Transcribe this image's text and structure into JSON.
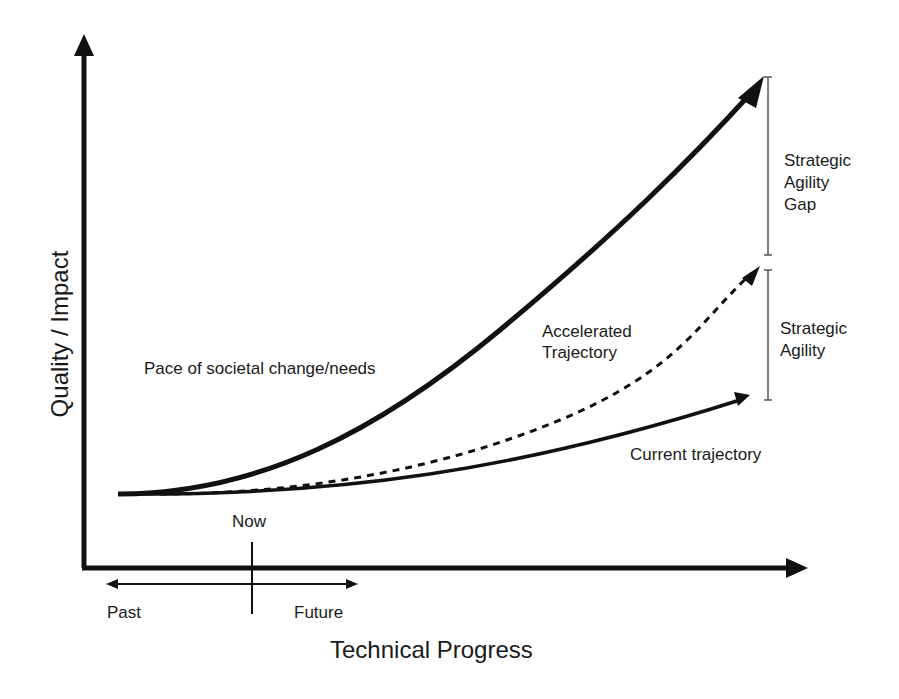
{
  "axes": {
    "x_label": "Technical Progress",
    "y_label": "Quality / Impact"
  },
  "timeline": {
    "now": "Now",
    "past": "Past",
    "future": "Future"
  },
  "curves": [
    {
      "id": "societal",
      "label": "Pace of societal change/needs",
      "style": "solid-thick"
    },
    {
      "id": "accelerated",
      "label_line1": "Accelerated",
      "label_line2": "Trajectory",
      "style": "dashed"
    },
    {
      "id": "current",
      "label": "Current trajectory",
      "style": "solid"
    }
  ],
  "brackets": {
    "gap": {
      "line1": "Strategic",
      "line2": "Agility",
      "line3": "Gap"
    },
    "agility": {
      "line1": "Strategic",
      "line2": "Agility"
    }
  },
  "colors": {
    "ink": "#111111",
    "background": "#ffffff"
  }
}
